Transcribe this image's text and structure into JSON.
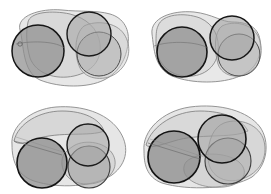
{
  "figure": {
    "background_color": "#ffffff",
    "width": 271,
    "height": 194,
    "panel_count": 4,
    "layout": "2x2 grid",
    "render_style": "grayscale translucent fills with fine vertical hatch texture and dark circle outlines"
  },
  "palette": {
    "background": "#ffffff",
    "blob_fill_light": "#d8d8d8",
    "blob_fill_mid": "#c4c4c4",
    "circle_fill_dark": "#8f8f8f",
    "circle_fill_mid": "#a8a8a8",
    "circle_fill_light": "#bdbdbd",
    "outline_dark": "#1a1a1a",
    "outline_mid": "#555555",
    "outline_light": "#8a8a8a",
    "hatch_line": "#9a9a9a"
  },
  "panels": [
    {
      "id": "panel-top-left",
      "label": "Panel 1",
      "position": "top-left",
      "blobs": [
        {
          "name": "outer-blob",
          "path": "M 20 30 C 16 16, 40 8, 62 10 C 80 12, 96 10, 110 14 C 124 18, 130 30, 128 44 C 126 58, 120 72, 104 80 C 88 88, 60 88, 40 80 C 22 72, 24 44, 20 30 Z",
          "fill": "#d8d8d8",
          "opacity": 0.62,
          "stroke": "#8a8a8a",
          "stroke_width": 0.9
        },
        {
          "name": "inner-blob",
          "path": "M 28 22 C 30 12, 52 10, 70 14 C 86 18, 98 28, 100 44 C 102 60, 92 72, 74 76 C 56 80, 36 74, 30 58 C 26 44, 26 32, 28 22 Z",
          "fill": "#cccccc",
          "opacity": 0.5,
          "stroke": "#7e7e7e",
          "stroke_width": 0.8
        },
        {
          "name": "right-lobe-blob",
          "path": "M 84 26 C 96 20, 116 22, 124 34 C 132 46, 130 62, 118 72 C 106 82, 86 80, 80 68 C 74 56, 74 34, 84 26 Z",
          "fill": "#c9c9c9",
          "opacity": 0.45,
          "stroke": "#8a8a8a",
          "stroke_width": 0.8
        }
      ],
      "circles": [
        {
          "name": "large-dark-circle",
          "cx": 38,
          "cy": 51,
          "r": 26,
          "fill": "#8d8d8d",
          "opacity": 0.72,
          "stroke": "#151515",
          "stroke_width": 1.5
        },
        {
          "name": "upper-right-circle",
          "cx": 89,
          "cy": 34,
          "r": 22,
          "fill": "#a3a3a3",
          "opacity": 0.55,
          "stroke": "#1a1a1a",
          "stroke_width": 1.4
        },
        {
          "name": "lower-right-circle",
          "cx": 99,
          "cy": 54,
          "r": 22,
          "fill": "#ababab",
          "opacity": 0.5,
          "stroke": "#4b4b4b",
          "stroke_width": 1.0
        }
      ],
      "marks": [
        {
          "name": "small-notch",
          "cx": 20,
          "cy": 44,
          "r": 2.2,
          "stroke": "#555555"
        }
      ]
    },
    {
      "id": "panel-top-right",
      "label": "Panel 2",
      "position": "top-right",
      "blobs": [
        {
          "name": "outer-blob",
          "path": "M 16 34 C 14 18, 36 10, 58 12 C 76 14, 86 22, 96 22 C 110 22, 122 26, 124 40 C 126 56, 120 70, 104 76 C 86 84, 56 84, 36 76 C 18 68, 18 48, 16 34 Z",
          "fill": "#dadada",
          "opacity": 0.62,
          "stroke": "#8a8a8a",
          "stroke_width": 0.9
        },
        {
          "name": "left-lobe-blob",
          "path": "M 22 26 C 26 14, 48 12, 64 18 C 78 24, 84 38, 82 52 C 80 68, 66 78, 48 76 C 30 74, 20 60, 20 44 C 20 36, 20 30, 22 26 Z",
          "fill": "#cfcfcf",
          "opacity": 0.5,
          "stroke": "#7e7e7e",
          "stroke_width": 0.8
        },
        {
          "name": "right-lobe-blob",
          "path": "M 86 26 C 98 20, 116 24, 122 36 C 128 48, 126 64, 114 72 C 102 80, 86 76, 82 64 C 78 50, 78 32, 86 26 Z",
          "fill": "#c7c7c7",
          "opacity": 0.45,
          "stroke": "#8a8a8a",
          "stroke_width": 0.8
        }
      ],
      "circles": [
        {
          "name": "large-dark-circle",
          "cx": 46,
          "cy": 52,
          "r": 25,
          "fill": "#8d8d8d",
          "opacity": 0.72,
          "stroke": "#151515",
          "stroke_width": 1.6
        },
        {
          "name": "upper-right-circle",
          "cx": 96,
          "cy": 38,
          "r": 22,
          "fill": "#a0a0a0",
          "opacity": 0.58,
          "stroke": "#171717",
          "stroke_width": 1.5
        },
        {
          "name": "lower-right-circle",
          "cx": 103,
          "cy": 55,
          "r": 21,
          "fill": "#aeaeae",
          "opacity": 0.45,
          "stroke": "#4f4f4f",
          "stroke_width": 1.0
        }
      ],
      "marks": []
    },
    {
      "id": "panel-bottom-left",
      "label": "Panel 3",
      "position": "bottom-left",
      "blobs": [
        {
          "name": "outer-blob",
          "path": "M 12 48 C 10 30, 30 12, 56 10 C 82 8, 106 16, 118 32 C 130 48, 128 66, 112 78 C 94 90, 58 92, 34 84 C 16 78, 12 62, 12 48 Z",
          "fill": "#d6d6d6",
          "opacity": 0.62,
          "stroke": "#8a8a8a",
          "stroke_width": 0.9
        },
        {
          "name": "upper-wedge-blob",
          "path": "M 14 44 C 18 26, 40 14, 62 14 C 84 14, 100 22, 104 34 C 90 40, 60 34, 36 42 C 26 46, 18 48, 14 44 Z",
          "fill": "#cbcbcb",
          "opacity": 0.55,
          "stroke": "#7a7a7a",
          "stroke_width": 0.8
        },
        {
          "name": "lower-right-blob",
          "path": "M 72 50 C 82 42, 104 44, 112 56 C 120 68, 112 82, 96 86 C 78 90, 64 82, 62 68 C 61 58, 66 54, 72 50 Z",
          "fill": "#c6c6c6",
          "opacity": 0.45,
          "stroke": "#888888",
          "stroke_width": 0.8
        }
      ],
      "circles": [
        {
          "name": "large-dark-circle",
          "cx": 42,
          "cy": 66,
          "r": 25,
          "fill": "#8a8a8a",
          "opacity": 0.74,
          "stroke": "#141414",
          "stroke_width": 1.6
        },
        {
          "name": "upper-right-circle",
          "cx": 88,
          "cy": 48,
          "r": 21,
          "fill": "#a5a5a5",
          "opacity": 0.58,
          "stroke": "#1b1b1b",
          "stroke_width": 1.4
        },
        {
          "name": "lower-right-circle",
          "cx": 89,
          "cy": 70,
          "r": 21,
          "fill": "#9b9b9b",
          "opacity": 0.55,
          "stroke": "#3d3d3d",
          "stroke_width": 1.1
        }
      ],
      "marks": [
        {
          "name": "diagonal-crease",
          "x1": 14,
          "y1": 44,
          "x2": 62,
          "y2": 58,
          "stroke": "#6f6f6f"
        }
      ]
    },
    {
      "id": "panel-bottom-right",
      "label": "Panel 4",
      "position": "bottom-right",
      "blobs": [
        {
          "name": "outer-blob",
          "path": "M 8 54 C 6 34, 26 14, 54 10 C 84 6, 112 14, 124 30 C 134 44, 132 68, 116 80 C 96 92, 52 94, 26 86 C 10 80, 8 66, 8 54 Z",
          "fill": "#d6d6d6",
          "opacity": 0.62,
          "stroke": "#8a8a8a",
          "stroke_width": 0.9
        },
        {
          "name": "upper-wedge-blob",
          "path": "M 10 48 C 16 28, 40 14, 64 14 C 88 14, 106 22, 112 34 C 96 42, 62 36, 38 44 C 24 48, 14 52, 10 48 Z",
          "fill": "#cbcbcb",
          "opacity": 0.5,
          "stroke": "#7a7a7a",
          "stroke_width": 0.8
        },
        {
          "name": "right-lobe-blob",
          "path": "M 88 26 C 104 20, 124 28, 128 44 C 132 60, 124 76, 106 82 C 88 88, 72 78, 72 60 C 72 42, 78 30, 88 26 Z",
          "fill": "#c4c4c4",
          "opacity": 0.42,
          "stroke": "#888888",
          "stroke_width": 0.8
        },
        {
          "name": "bottom-lobe-blob",
          "path": "M 54 62 C 68 54, 94 56, 104 66 C 114 76, 106 88, 88 90 C 66 92, 50 84, 48 74 C 47 68, 50 64, 54 62 Z",
          "fill": "#bfbfbf",
          "opacity": 0.42,
          "stroke": "#8a8a8a",
          "stroke_width": 0.8
        }
      ],
      "circles": [
        {
          "name": "large-dark-circle",
          "cx": 38,
          "cy": 60,
          "r": 26,
          "fill": "#8a8a8a",
          "opacity": 0.74,
          "stroke": "#141414",
          "stroke_width": 1.7
        },
        {
          "name": "upper-right-circle",
          "cx": 86,
          "cy": 42,
          "r": 24,
          "fill": "#9e9e9e",
          "opacity": 0.6,
          "stroke": "#151515",
          "stroke_width": 1.6
        },
        {
          "name": "lower-right-circle",
          "cx": 92,
          "cy": 64,
          "r": 23,
          "fill": "#a6a6a6",
          "opacity": 0.5,
          "stroke": "#3f3f3f",
          "stroke_width": 1.1
        }
      ],
      "marks": [
        {
          "name": "diagonal-crease",
          "x1": 12,
          "y1": 46,
          "x2": 64,
          "y2": 62,
          "stroke": "#6f6f6f"
        }
      ]
    }
  ]
}
